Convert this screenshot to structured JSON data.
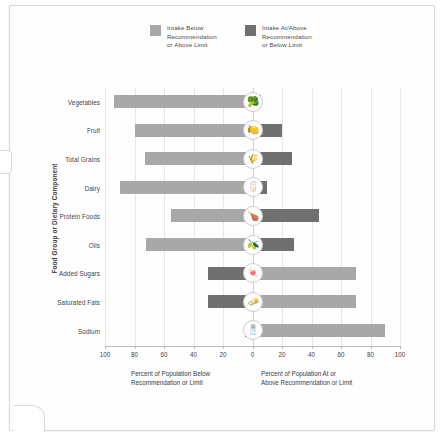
{
  "chart_data": {
    "type": "bar",
    "orientation": "horizontal-diverging",
    "title": "",
    "xlabel_left": "Percent of Population Below\nRecommendation or Limit",
    "xlabel_right": "Percent of Population At or\nAbove Recommendation or Limit",
    "ylabel": "Food Group or Dietary Component",
    "xlim": [
      -100,
      100
    ],
    "xticks": [
      100,
      80,
      60,
      40,
      20,
      0,
      20,
      40,
      60,
      80,
      100
    ],
    "grid": true,
    "legend_position": "top",
    "categories": [
      "Vegetables",
      "Fruit",
      "Total Grains",
      "Dairy",
      "Protein Foods",
      "Oils",
      "Added Sugars",
      "Saturated Fats",
      "Sodium"
    ],
    "series": [
      {
        "name": "Intake Below Recommendation or Above Limit",
        "color": "#a8a8a8",
        "side": "left",
        "values": [
          94,
          80,
          73,
          90,
          55,
          72,
          30,
          30,
          5
        ]
      },
      {
        "name": "Intake At/Above Recommendation or Below Limit",
        "color": "#707070",
        "side": "right",
        "values": [
          6,
          20,
          27,
          10,
          45,
          28,
          70,
          70,
          90
        ]
      }
    ],
    "reversed_color_rows": [
      "Added Sugars",
      "Saturated Fats",
      "Sodium"
    ],
    "markers": [
      {
        "category": "Vegetables",
        "icon": "broccoli-icon",
        "glyph": "🥦"
      },
      {
        "category": "Fruit",
        "icon": "fruit-icon",
        "glyph": "🍋"
      },
      {
        "category": "Total Grains",
        "icon": "grains-icon",
        "glyph": "🌾"
      },
      {
        "category": "Dairy",
        "icon": "dairy-icon",
        "glyph": "🥛"
      },
      {
        "category": "Protein Foods",
        "icon": "protein-foods-icon",
        "glyph": "🍗"
      },
      {
        "category": "Oils",
        "icon": "oils-icon",
        "glyph": "🫒"
      },
      {
        "category": "Added Sugars",
        "icon": "added-sugars-icon",
        "glyph": "🍬"
      },
      {
        "category": "Saturated Fats",
        "icon": "saturated-fats-icon",
        "glyph": "🧈"
      },
      {
        "category": "Sodium",
        "icon": "sodium-icon",
        "glyph": "🧂"
      }
    ]
  },
  "legend": {
    "items": [
      {
        "label": "Intake Below\nRecommendation\nor Above Limit",
        "color": "#a8a8a8",
        "swatch_name": "legend-swatch-below"
      },
      {
        "label": "Intake At/Above\nRecommendation\nor Below Limit",
        "color": "#707070",
        "swatch_name": "legend-swatch-at-above"
      }
    ]
  },
  "axis": {
    "y_title": "Food Group or Dietary Component",
    "tick_labels": [
      "100",
      "80",
      "60",
      "40",
      "20",
      "0",
      "20",
      "40",
      "60",
      "80",
      "100"
    ],
    "caption_left": "Percent of Population Below\nRecommendation or Limit",
    "caption_right": "Percent of Population At or\nAbove Recommendation or Limit"
  },
  "colors": {
    "light_gray": "#a8a8a8",
    "dark_gray": "#707070",
    "gridline": "#e6e6e6",
    "axis": "#b9b9b9",
    "text": "#3c3c3c"
  }
}
